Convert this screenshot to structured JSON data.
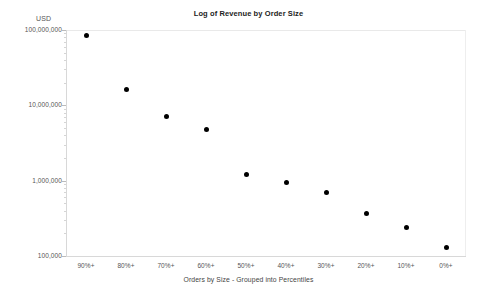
{
  "chart_data": {
    "type": "scatter",
    "title": "Log of Revenue by Order Size",
    "xlabel": "Orders by Size - Grouped into Percentiles",
    "ylabel": "USD",
    "yscale": "log",
    "ylim": [
      100000,
      100000000
    ],
    "grid": false,
    "legend": null,
    "categories": [
      "90%+",
      "80%+",
      "70%+",
      "60%+",
      "50%+",
      "40%+",
      "30%+",
      "20%+",
      "10%+",
      "0%+"
    ],
    "values": [
      85000000,
      16000000,
      7200000,
      4800000,
      1200000,
      950000,
      700000,
      370000,
      240000,
      130000
    ],
    "y_tick_labels": [
      "100,000,000",
      "10,000,000",
      "1,000,000",
      "100,000"
    ],
    "y_tick_values": [
      100000000,
      10000000,
      1000000,
      100000
    ],
    "marker": {
      "shape": "circle",
      "color": "#000000",
      "size": 5
    }
  },
  "colors": {
    "background": "#ffffff",
    "marker": "#000000",
    "axis": "#d8d8d8",
    "text": "#555555",
    "title": "#222222"
  }
}
